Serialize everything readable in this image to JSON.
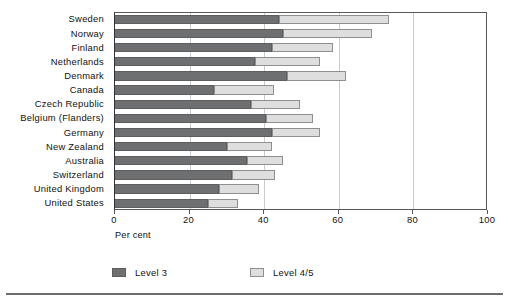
{
  "chart_data": {
    "type": "bar",
    "orientation": "horizontal",
    "stacked": true,
    "title": "",
    "subtitle": "",
    "xlabel": "Per cent",
    "ylabel": "",
    "xlim": [
      0,
      100
    ],
    "xticks": [
      0,
      20,
      40,
      60,
      80,
      100
    ],
    "xtick_labels": [
      "0",
      "20",
      "40",
      "60",
      "80",
      "100"
    ],
    "grid": "vertical",
    "legend_position": "bottom",
    "categories": [
      "Sweden",
      "Norway",
      "Finland",
      "Netherlands",
      "Denmark",
      "Canada",
      "Czech Republic",
      "Belgium (Flanders)",
      "Germany",
      "New Zealand",
      "Australia",
      "Switzerland",
      "United Kingdom",
      "United States"
    ],
    "series": [
      {
        "name": "Level 3",
        "color": "#6d6f71",
        "values": [
          44.0,
          45.0,
          42.0,
          37.5,
          46.0,
          26.5,
          36.5,
          40.5,
          42.0,
          30.0,
          35.5,
          31.5,
          28.0,
          25.0
        ]
      },
      {
        "name": "Level 4/5",
        "color": "#dddedd",
        "values": [
          29.5,
          24.0,
          16.5,
          17.5,
          16.0,
          16.0,
          13.0,
          12.5,
          13.0,
          12.0,
          9.5,
          11.5,
          10.5,
          8.0
        ]
      }
    ],
    "totals": [
      73.5,
      69.0,
      58.5,
      55.0,
      62.0,
      42.5,
      49.5,
      53.0,
      55.0,
      42.0,
      45.0,
      43.0,
      38.5,
      33.0
    ]
  },
  "legend": {
    "entries": [
      {
        "label": "Level 3",
        "color": "#6d6f71"
      },
      {
        "label": "Level 4/5",
        "color": "#dddedd"
      }
    ]
  },
  "axis": {
    "x_title": "Per cent"
  }
}
